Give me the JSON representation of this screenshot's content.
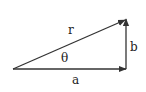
{
  "diagram": {
    "type": "vector-triangle",
    "labels": {
      "hypotenuse": "r",
      "angle": "θ",
      "vertical": "b",
      "horizontal": "a"
    },
    "colors": {
      "stroke": "#333333",
      "background": "#ffffff"
    }
  }
}
